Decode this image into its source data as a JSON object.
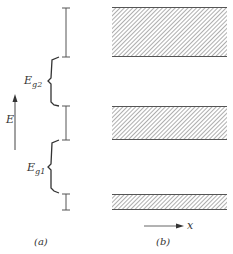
{
  "figure": {
    "panel_a": {
      "caption": "(a)",
      "axis_label": "E",
      "gaps": [
        {
          "label_main": "E",
          "label_sub": "g2"
        },
        {
          "label_main": "E",
          "label_sub": "g1"
        }
      ],
      "bands": [
        {
          "top": 7,
          "bottom": 57
        },
        {
          "top": 106,
          "bottom": 140
        },
        {
          "top": 194,
          "bottom": 210
        }
      ]
    },
    "panel_b": {
      "caption": "(b)",
      "axis_label": "x"
    },
    "colors": {
      "line": "#555555",
      "hatch": "#777777",
      "text": "#333333"
    }
  }
}
